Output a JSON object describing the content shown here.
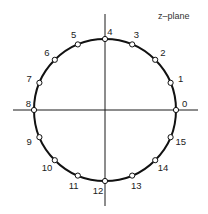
{
  "diagram": {
    "title_label": "z–plane",
    "colors": {
      "stroke": "#111111",
      "axis": "#1a1a1a",
      "point_fill": "#ffffff",
      "text": "#222222",
      "background": "#ffffff"
    },
    "geometry": {
      "center": [
        105,
        110
      ],
      "radius": 71,
      "horizontal_axis": {
        "x1": 13,
        "x2": 198,
        "y": 110
      },
      "vertical_axis": {
        "x": 105,
        "y1": 14,
        "y2": 206
      },
      "point_radius": 2.6,
      "label_offset": 11
    },
    "points": [
      {
        "index": 0,
        "label": "0",
        "angle_deg": 0
      },
      {
        "index": 1,
        "label": "1",
        "angle_deg": 22.5
      },
      {
        "index": 2,
        "label": "2",
        "angle_deg": 45
      },
      {
        "index": 3,
        "label": "3",
        "angle_deg": 67.5
      },
      {
        "index": 4,
        "label": "4",
        "angle_deg": 90
      },
      {
        "index": 5,
        "label": "5",
        "angle_deg": 112.5
      },
      {
        "index": 6,
        "label": "6",
        "angle_deg": 135
      },
      {
        "index": 7,
        "label": "7",
        "angle_deg": 157.5
      },
      {
        "index": 8,
        "label": "8",
        "angle_deg": 180
      },
      {
        "index": 9,
        "label": "9",
        "angle_deg": 202.5
      },
      {
        "index": 10,
        "label": "10",
        "angle_deg": 225
      },
      {
        "index": 11,
        "label": "11",
        "angle_deg": 247.5
      },
      {
        "index": 12,
        "label": "12",
        "angle_deg": 270
      },
      {
        "index": 13,
        "label": "13",
        "angle_deg": 292.5
      },
      {
        "index": 14,
        "label": "14",
        "angle_deg": 315
      },
      {
        "index": 15,
        "label": "15",
        "angle_deg": 337.5
      }
    ]
  }
}
